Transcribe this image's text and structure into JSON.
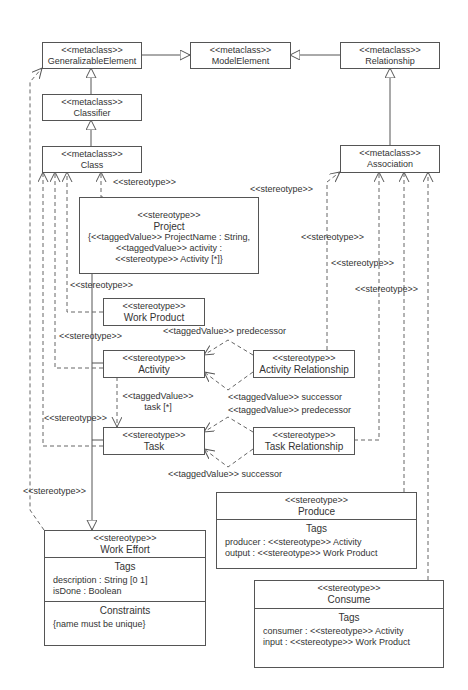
{
  "stereo_meta": "<<metaclass>>",
  "stereo": "<<stereotype>>",
  "metaclasses": {
    "generalizable": "GeneralizableElement",
    "model_element": "ModelElement",
    "relationship": "Relationship",
    "classifier": "Classifier",
    "class": "Class",
    "association": "Association"
  },
  "project": {
    "name": "Project",
    "line1": "{<<taggedValue>> ProjectName : String,",
    "line2": "<<taggedValue>> activity :",
    "line3": "<<stereotype>> Activity [*]}"
  },
  "work_product": "Work Product",
  "activity": "Activity",
  "activity_relationship": "Activity Relationship",
  "task": "Task",
  "task_relationship": "Task Relationship",
  "work_effort": {
    "name": "Work Effort",
    "tags_title": "Tags",
    "tags": [
      "description : String [0 1]",
      "isDone : Boolean"
    ],
    "constraints_title": "Constraints",
    "constraints": [
      "{name must be unique}"
    ]
  },
  "produce": {
    "name": "Produce",
    "tags_title": "Tags",
    "tags": [
      "producer : <<stereotype>> Activity",
      "output : <<stereotype>> Work Product"
    ]
  },
  "consume": {
    "name": "Consume",
    "tags_title": "Tags",
    "tags": [
      "consumer : <<stereotype>> Activity",
      "input : <<stereotype>> Work Product"
    ]
  },
  "labels": {
    "stereotype": "<<stereotype>>",
    "tv_predecessor": "<<taggedValue>> predecessor",
    "tv_successor": "<<taggedValue>> successor",
    "tv_task": "<<taggedValue>>",
    "tv_task2": "task [*]"
  }
}
